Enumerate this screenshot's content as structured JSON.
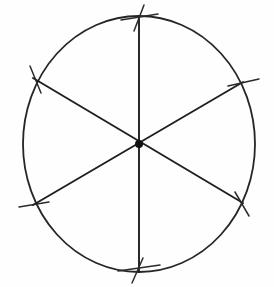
{
  "figure": {
    "title": "Circle divided into six equal sectors",
    "style": "hand-drawn pencil line art",
    "background_color": "#fefefe",
    "line_color": "#1f1f1f",
    "center_dot_color": "#111111"
  },
  "canvas": {
    "width": 274,
    "height": 287
  },
  "chart_data": {
    "type": "pie",
    "title": "Circle divided into six equal sectors",
    "categories": [
      "Sector 1",
      "Sector 2",
      "Sector 3",
      "Sector 4",
      "Sector 5",
      "Sector 6"
    ],
    "values": [
      60,
      60,
      60,
      60,
      60,
      60
    ],
    "unit": "degrees",
    "slice_count": 6,
    "slice_angle_degrees": 60,
    "labels_shown": false,
    "legend": false,
    "grid": false
  },
  "geometry": {
    "circle": {
      "name": "circle-outline",
      "center_x": 139,
      "center_y": 144,
      "radius_x": 116,
      "radius_y": 128,
      "stroke_width": 1.8
    },
    "center_point": {
      "name": "center-dot",
      "x": 139,
      "y": 144,
      "radius": 4
    },
    "diameters": [
      {
        "name": "vertical-diameter",
        "angle_degrees": 90,
        "x1": 139,
        "y1": 16,
        "x2": 139,
        "y2": 272
      },
      {
        "name": "upper-right-to-lower-left-diameter",
        "angle_degrees": 30,
        "x1": 243,
        "y1": 82,
        "x2": 33,
        "y2": 205
      },
      {
        "name": "upper-left-to-lower-right-diameter",
        "angle_degrees": 150,
        "x1": 33,
        "y1": 78,
        "x2": 243,
        "y2": 203
      }
    ],
    "vertices": [
      {
        "name": "vertex-top",
        "x": 139,
        "y": 16,
        "angle_degrees": 90
      },
      {
        "name": "vertex-upper-right",
        "x": 243,
        "y": 82,
        "angle_degrees": 30
      },
      {
        "name": "vertex-lower-right",
        "x": 243,
        "y": 203,
        "angle_degrees": 330
      },
      {
        "name": "vertex-bottom",
        "x": 139,
        "y": 272,
        "angle_degrees": 270
      },
      {
        "name": "vertex-lower-left",
        "x": 33,
        "y": 205,
        "angle_degrees": 210
      },
      {
        "name": "vertex-upper-left",
        "x": 33,
        "y": 78,
        "angle_degrees": 150
      }
    ],
    "tick_marks": [
      {
        "name": "tick-top",
        "x1": 121,
        "y1": 20,
        "x2": 158,
        "y2": 14
      },
      {
        "name": "tick-top-cross",
        "x1": 144,
        "y1": 5,
        "x2": 134,
        "y2": 31
      },
      {
        "name": "tick-upper-right",
        "x1": 228,
        "y1": 86,
        "x2": 259,
        "y2": 79
      },
      {
        "name": "tick-lower-right",
        "x1": 235,
        "y1": 192,
        "x2": 249,
        "y2": 216
      },
      {
        "name": "tick-bottom",
        "x1": 118,
        "y1": 271,
        "x2": 160,
        "y2": 265
      },
      {
        "name": "tick-bottom-cross",
        "x1": 143,
        "y1": 258,
        "x2": 132,
        "y2": 283
      },
      {
        "name": "tick-lower-left",
        "x1": 19,
        "y1": 207,
        "x2": 49,
        "y2": 202
      },
      {
        "name": "tick-upper-left",
        "x1": 30,
        "y1": 66,
        "x2": 41,
        "y2": 93
      }
    ]
  }
}
